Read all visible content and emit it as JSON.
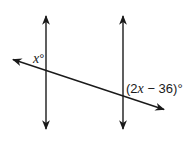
{
  "diagram": {
    "stroke_color": "#1a1a1a",
    "lines": {
      "left_parallel": {
        "x": 46,
        "y1": 15,
        "y2": 130
      },
      "right_parallel": {
        "x": 123,
        "y1": 15,
        "y2": 130
      },
      "transversal": {
        "x1": 12,
        "y1": 59,
        "x2": 165,
        "y2": 110
      }
    },
    "labels": {
      "angle_left": {
        "variable": "x",
        "suffix": "°"
      },
      "angle_right": {
        "open": "(2",
        "variable": "x",
        "rest": " − 36)",
        "suffix": "°"
      }
    }
  }
}
